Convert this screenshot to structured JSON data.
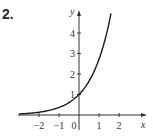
{
  "problem_number": "2.",
  "chart_data": {
    "type": "line",
    "title": "",
    "function": "y = e^x",
    "xlabel": "x",
    "ylabel": "y",
    "x_ticks": [
      -2,
      -1,
      0,
      1,
      2
    ],
    "x_tick_labels": [
      "−2",
      "−1",
      "0",
      "1",
      "2"
    ],
    "y_ticks": [
      1,
      2,
      3,
      4
    ],
    "y_tick_labels": [
      "1",
      "2",
      "3",
      "4"
    ],
    "xlim": [
      -3,
      2.6
    ],
    "ylim": [
      0,
      5
    ],
    "grid": false,
    "series": [
      {
        "name": "y = e^x",
        "x": [
          -3,
          -2.5,
          -2,
          -1.5,
          -1,
          -0.5,
          0,
          0.5,
          1,
          1.5,
          1.6
        ],
        "y": [
          0.05,
          0.08,
          0.14,
          0.22,
          0.37,
          0.61,
          1,
          1.65,
          2.72,
          4.48,
          4.95
        ]
      }
    ]
  }
}
